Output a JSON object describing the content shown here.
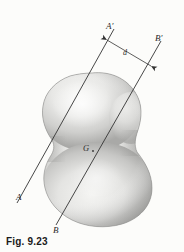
{
  "figure": {
    "caption": "Fig. 9.23",
    "background_color": "#fcfcfa",
    "ink_color": "#333333",
    "body": {
      "name": "irregular-rigid-body",
      "description": "Shaded irregular three-dimensional peanut-shaped rigid body",
      "fill_light": "#f2f2f0",
      "fill_mid": "#d2d2d0",
      "fill_dark": "#9a9a98",
      "outline_color": "#8d8d8b"
    },
    "labels": {
      "axis_a_lower": "A",
      "axis_a_upper": "A′",
      "axis_b_lower": "B",
      "axis_b_upper": "B′",
      "distance": "d",
      "center_of_mass": "G"
    },
    "lines": [
      {
        "name": "axis-AA-prime",
        "from_label": "A",
        "to_label": "A′",
        "x1": 17,
        "y1": 203,
        "x2": 114,
        "y2": 29
      },
      {
        "name": "axis-BB-prime",
        "from_label": "B",
        "to_label": "B′",
        "x1": 56,
        "y1": 225,
        "x2": 161,
        "y2": 41
      }
    ],
    "dimension": {
      "name": "separation-distance-d",
      "label": "d",
      "x1": 106,
      "y1": 39,
      "x2": 152,
      "y2": 66,
      "arrowheads": "both"
    },
    "center_of_mass_point": {
      "x": 92,
      "y": 150
    }
  }
}
